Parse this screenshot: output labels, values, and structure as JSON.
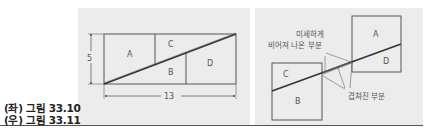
{
  "captions": [
    "(좌) 그림 33.10",
    "(우) 그림 33.11"
  ],
  "left_figure": {
    "pieces": [
      "A",
      "C",
      "B",
      "D"
    ],
    "height_label": "5",
    "width_label": "13"
  },
  "right_figure": {
    "pieces": [
      "A",
      "D",
      "C",
      "B"
    ],
    "annotation_gap_line1": "미세하게",
    "annotation_gap_line2": "비어져 나온 부분",
    "annotation_overlap": "겹쳐진 부분"
  },
  "colors": {
    "panel_bg": "#ececec",
    "line": "#555555",
    "diagonal": "#333333"
  }
}
